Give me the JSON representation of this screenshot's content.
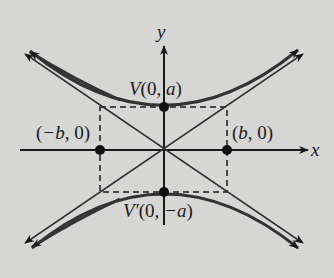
{
  "diagram": {
    "type": "hyperbola",
    "background": "#d6d6d4",
    "ink": "#1a1a1a",
    "axes": {
      "x_label": "x",
      "y_label": "y"
    },
    "labels": {
      "vertex_top": {
        "name": "V",
        "open": "(0, ",
        "var": "a",
        "close": ")"
      },
      "vertex_bottom": {
        "name": "V′",
        "open": "(0, ",
        "var": "−a",
        "close": ")"
      },
      "left_point": {
        "open": "(",
        "var": "−b",
        "close": ", 0)"
      },
      "right_point": {
        "open": "(",
        "var": "b",
        "close": ", 0)"
      }
    }
  }
}
